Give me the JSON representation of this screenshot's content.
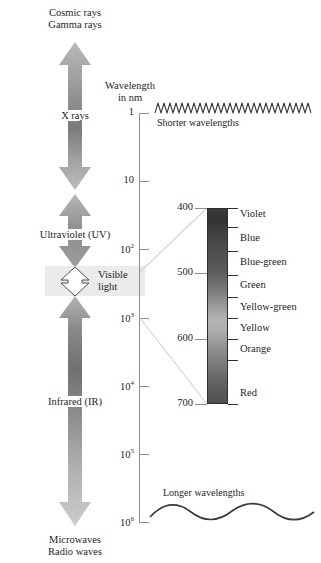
{
  "figure": {
    "title_none": "",
    "axis": {
      "caption_line1": "Wavelength",
      "caption_line2": "in nm",
      "ticks": [
        {
          "label": "1",
          "sup": "",
          "y": 113
        },
        {
          "label": "10",
          "sup": "",
          "y": 181
        },
        {
          "label": "10",
          "sup": "2",
          "y": 249
        },
        {
          "label": "10",
          "sup": "3",
          "y": 318
        },
        {
          "label": "10",
          "sup": "4",
          "y": 386
        },
        {
          "label": "10",
          "sup": "5",
          "y": 454
        },
        {
          "label": "10",
          "sup": "6",
          "y": 522
        }
      ]
    },
    "waves": {
      "short_label": "Shorter wavelengths",
      "long_label": "Longer wavelengths"
    },
    "bands": [
      {
        "name": "cosmic-gamma",
        "line1": "Cosmic rays",
        "line2": "Gamma rays"
      },
      {
        "name": "x-rays",
        "line1": "X rays",
        "line2": ""
      },
      {
        "name": "ultraviolet",
        "line1": "Ultraviolet (UV)",
        "line2": ""
      },
      {
        "name": "visible-light",
        "line1": "Visible",
        "line2": "light"
      },
      {
        "name": "infrared",
        "line1": "Infrared (IR)",
        "line2": ""
      },
      {
        "name": "microwaves-radio",
        "line1": "Microwaves",
        "line2": "Radio waves"
      }
    ],
    "spectrum": {
      "scale_labels": [
        {
          "value": "400",
          "y": 208
        },
        {
          "value": "500",
          "y": 273
        },
        {
          "value": "600",
          "y": 339
        },
        {
          "value": "700",
          "y": 404
        }
      ],
      "colors": [
        {
          "label": "Violet",
          "y": 214
        },
        {
          "label": "Blue",
          "y": 238
        },
        {
          "label": "Blue-green",
          "y": 262
        },
        {
          "label": "Green",
          "y": 285
        },
        {
          "label": "Yellow-green",
          "y": 307
        },
        {
          "label": "Yellow",
          "y": 328
        },
        {
          "label": "Orange",
          "y": 349
        },
        {
          "label": "Red",
          "y": 393
        }
      ]
    },
    "palette": {
      "text": "#231f20",
      "axis_gray": "#8e8e8e",
      "arrow_gray": "#a6a6a6",
      "arrow_dark": "#6e6e6e",
      "visible_band_bg": "#ebebeb",
      "connector_gray": "#cfcfcf"
    }
  }
}
